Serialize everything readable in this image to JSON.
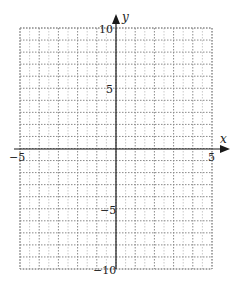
{
  "graph": {
    "x_axis_label": "x",
    "y_axis_label": "y",
    "x_range": [
      -5,
      5
    ],
    "y_range": [
      -10,
      10
    ],
    "x_tick_labels": [
      {
        "value": -5,
        "label": "−5"
      },
      {
        "value": 5,
        "label": "5"
      }
    ],
    "y_tick_labels": [
      {
        "value": 10,
        "label": "10"
      },
      {
        "value": 5,
        "label": "5"
      },
      {
        "value": -5,
        "label": "−5"
      },
      {
        "value": -10,
        "label": "−10"
      }
    ],
    "grid": {
      "x_step": 1,
      "y_step": 1,
      "style": "dotted",
      "color": "#8a8a8a"
    },
    "axis_color": "#1a1a1a"
  }
}
